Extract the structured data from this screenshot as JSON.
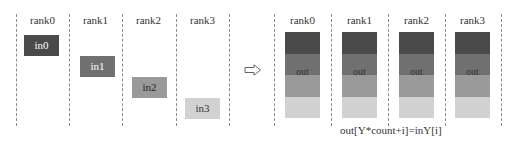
{
  "before": {
    "ranks": [
      {
        "label": "rank0",
        "input": "in0",
        "color": "#4a4a4a",
        "text_color": "#ffffff"
      },
      {
        "label": "rank1",
        "input": "in1",
        "color": "#707070",
        "text_color": "#ffffff"
      },
      {
        "label": "rank2",
        "input": "in2",
        "color": "#9a9a9a",
        "text_color": "#222222"
      },
      {
        "label": "rank3",
        "input": "in3",
        "color": "#d2d2d2",
        "text_color": "#333333"
      }
    ]
  },
  "arrow": {
    "icon": "right-arrow-icon"
  },
  "after": {
    "ranks": [
      {
        "label": "rank0",
        "output": "out"
      },
      {
        "label": "rank1",
        "output": "out"
      },
      {
        "label": "rank2",
        "output": "out"
      },
      {
        "label": "rank3",
        "output": "out"
      }
    ],
    "band_colors": [
      "#4a4a4a",
      "#707070",
      "#9a9a9a",
      "#d2d2d2"
    ]
  },
  "formula": "out[Y*count+i]=inY[i]"
}
